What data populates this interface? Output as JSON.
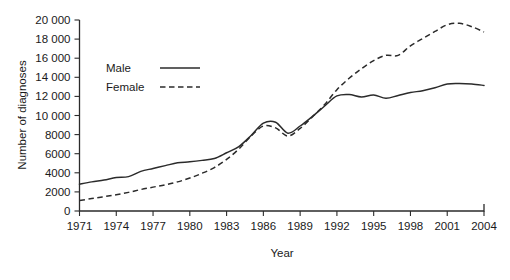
{
  "chart_data": {
    "type": "line",
    "title": "",
    "subtitle": "",
    "xlabel": "Year",
    "ylabel": "Number of diagnoses",
    "xlim": [
      1971,
      2004
    ],
    "ylim": [
      0,
      20000
    ],
    "grid": false,
    "legend_position": "upper-left-inside",
    "x_tick_labels": [
      "1971",
      "1974",
      "1977",
      "1980",
      "1983",
      "1986",
      "1989",
      "1992",
      "1995",
      "1998",
      "2001",
      "2004"
    ],
    "x_ticks": [
      1971,
      1974,
      1977,
      1980,
      1983,
      1986,
      1989,
      1992,
      1995,
      1998,
      2001,
      2004
    ],
    "y_tick_labels": [
      "0",
      "2000",
      "4000",
      "6000",
      "8000",
      "10 000",
      "12 000",
      "14 000",
      "16 000",
      "18 000",
      "20 000"
    ],
    "y_ticks": [
      0,
      2000,
      4000,
      6000,
      8000,
      10000,
      12000,
      14000,
      16000,
      18000,
      20000
    ],
    "x": [
      1971,
      1972,
      1973,
      1974,
      1975,
      1976,
      1977,
      1978,
      1979,
      1980,
      1981,
      1982,
      1983,
      1984,
      1985,
      1986,
      1987,
      1988,
      1989,
      1990,
      1991,
      1992,
      1993,
      1994,
      1995,
      1996,
      1997,
      1998,
      1999,
      2000,
      2001,
      2002,
      2003,
      2004
    ],
    "series": [
      {
        "name": "Male",
        "style": "solid",
        "color": "#2b2b2b",
        "values": [
          2800,
          3050,
          3250,
          3500,
          3600,
          4150,
          4450,
          4750,
          5050,
          5150,
          5300,
          5500,
          6100,
          6750,
          7900,
          9200,
          9300,
          8150,
          8900,
          9900,
          11000,
          12050,
          12200,
          11950,
          12150,
          11800,
          12100,
          12400,
          12600,
          12900,
          13300,
          13350,
          13300,
          13150
        ]
      },
      {
        "name": "Female",
        "style": "dashed",
        "color": "#2b2b2b",
        "values": [
          1100,
          1300,
          1500,
          1700,
          1950,
          2250,
          2500,
          2750,
          3050,
          3450,
          3950,
          4550,
          5400,
          6500,
          7850,
          8900,
          8700,
          7850,
          8650,
          9850,
          11150,
          12700,
          13900,
          14900,
          15750,
          16300,
          16300,
          17300,
          18050,
          18800,
          19500,
          19650,
          19300,
          18750
        ]
      }
    ]
  },
  "legend": {
    "items": [
      {
        "label": "Male",
        "style": "solid"
      },
      {
        "label": "Female",
        "style": "dashed"
      }
    ]
  }
}
